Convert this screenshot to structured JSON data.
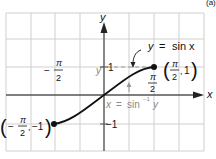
{
  "figure_tag": "(a)",
  "axes": {
    "x_label": "x",
    "y_label": "y"
  },
  "curve_label": {
    "lhs": "y",
    "eq": "=",
    "rhs": "sin x"
  },
  "inverse_label": {
    "lhs": "x",
    "eq": "=",
    "rhs": "sin",
    "sup": "−1",
    "arg": "y"
  },
  "y_tick_pos": "1",
  "y_tick_neg": "−1",
  "y_marker": "y",
  "neg_pi_half": {
    "sign": "−",
    "num": "π",
    "den": "2"
  },
  "pos_pi_half": {
    "num": "π",
    "den": "2"
  },
  "point_right": {
    "open": "(",
    "num": "π",
    "den": "2",
    "sep": ",",
    "y": "1",
    "close": ")"
  },
  "point_left": {
    "open": "(",
    "sign": "−",
    "num": "π",
    "den": "2",
    "sep": ",",
    "y": "−1",
    "close": ")"
  },
  "colors": {
    "grid": "#c8c8c8",
    "axis": "#555555",
    "curve": "#111111",
    "muted": "#8a8a8a"
  }
}
